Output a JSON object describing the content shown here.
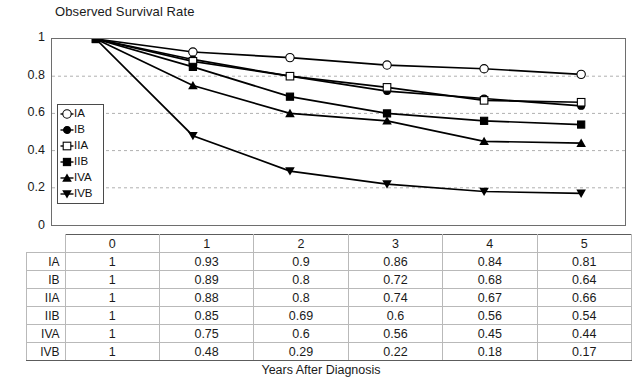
{
  "chart_data": {
    "type": "line",
    "title": "Observed Survival Rate",
    "xlabel": "Years After Diagnosis",
    "ylabel": "",
    "x": [
      0,
      1,
      2,
      3,
      4,
      5
    ],
    "categories": [
      "0",
      "1",
      "2",
      "3",
      "4",
      "5"
    ],
    "xlim": [
      0,
      5
    ],
    "ylim": [
      0,
      1
    ],
    "yticks": [
      "1",
      "0.8",
      "0.6",
      "0.4",
      "0.2",
      "0"
    ],
    "ytick_values": [
      1,
      0.8,
      0.6,
      0.4,
      0.2,
      0
    ],
    "grid": "horizontal-dashed",
    "legend_position": "inner-left",
    "series": [
      {
        "name": "IA",
        "marker": "open-circle",
        "values": [
          1,
          0.93,
          0.9,
          0.86,
          0.84,
          0.81
        ]
      },
      {
        "name": "IB",
        "marker": "filled-circle",
        "values": [
          1,
          0.89,
          0.8,
          0.72,
          0.68,
          0.64
        ]
      },
      {
        "name": "IIA",
        "marker": "open-square",
        "values": [
          1,
          0.88,
          0.8,
          0.74,
          0.67,
          0.66
        ]
      },
      {
        "name": "IIB",
        "marker": "filled-square",
        "values": [
          1,
          0.85,
          0.69,
          0.6,
          0.56,
          0.54
        ]
      },
      {
        "name": "IVA",
        "marker": "filled-triangle-up",
        "values": [
          1,
          0.75,
          0.6,
          0.56,
          0.45,
          0.44
        ]
      },
      {
        "name": "IVB",
        "marker": "filled-triangle-down",
        "values": [
          1,
          0.48,
          0.29,
          0.22,
          0.18,
          0.17
        ]
      }
    ]
  },
  "legend": {
    "items": [
      {
        "label": "IA",
        "marker": "open-circle"
      },
      {
        "label": "IB",
        "marker": "filled-circle"
      },
      {
        "label": "IIA",
        "marker": "open-square"
      },
      {
        "label": "IIB",
        "marker": "filled-square"
      },
      {
        "label": "IVA",
        "marker": "filled-triangle-up"
      },
      {
        "label": "IVB",
        "marker": "filled-triangle-down"
      }
    ]
  },
  "table": {
    "corner_label": "",
    "column_headers": [
      "0",
      "1",
      "2",
      "3",
      "4",
      "5"
    ],
    "rows": [
      {
        "label": "IA",
        "values": [
          "1",
          "0.93",
          "0.9",
          "0.86",
          "0.84",
          "0.81"
        ]
      },
      {
        "label": "IB",
        "values": [
          "1",
          "0.89",
          "0.8",
          "0.72",
          "0.68",
          "0.64"
        ]
      },
      {
        "label": "IIA",
        "values": [
          "1",
          "0.88",
          "0.8",
          "0.74",
          "0.67",
          "0.66"
        ]
      },
      {
        "label": "IIB",
        "values": [
          "1",
          "0.85",
          "0.69",
          "0.6",
          "0.56",
          "0.54"
        ]
      },
      {
        "label": "IVA",
        "values": [
          "1",
          "0.75",
          "0.6",
          "0.56",
          "0.45",
          "0.44"
        ]
      },
      {
        "label": "IVB",
        "values": [
          "1",
          "0.48",
          "0.29",
          "0.22",
          "0.18",
          "0.17"
        ]
      }
    ]
  },
  "colors": {
    "line": "#000000",
    "axis": "#6e6e6e",
    "grid": "#b0b0b0",
    "text": "#1a1a1a",
    "table_border": "#b9b9b9"
  }
}
